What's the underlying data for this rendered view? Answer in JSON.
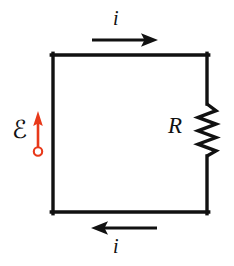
{
  "figure": {
    "kind": "circuit-diagram",
    "background_color": "#ffffff",
    "width": 234,
    "height": 266
  },
  "colors": {
    "wire": "#111111",
    "arrow_current": "#111111",
    "emf_accent": "#e8391a",
    "text": "#111111"
  },
  "labels": {
    "current_top": "i",
    "current_bottom": "i",
    "resistance": "R",
    "emf": "ℰ"
  },
  "components": {
    "loop": {
      "name": "circuit-loop",
      "left_x": 53,
      "right_x": 207,
      "top_y": 55,
      "bottom_y": 212,
      "stroke_width": 3.4
    },
    "resistor": {
      "name": "resistor",
      "label": "R",
      "orientation": "vertical",
      "center_x": 207,
      "top_y": 103,
      "bottom_y": 157,
      "zigzag_amplitude": 9,
      "zigzag_cycles": 4
    },
    "emf_source": {
      "name": "emf-source",
      "label": "ℰ",
      "arrow_x": 38,
      "arrow_tail_y": 151,
      "arrow_tip_y": 112,
      "terminal_circle_y": 151,
      "terminal_circle_radius": 4.2,
      "direction": "up",
      "color": "#e8391a"
    },
    "current_arrow_top": {
      "name": "current-arrow-top",
      "label": "i",
      "y": 40,
      "start_x": 92,
      "end_x": 157,
      "direction": "right"
    },
    "current_arrow_bottom": {
      "name": "current-arrow-bottom",
      "label": "i",
      "y": 228,
      "start_x": 157,
      "end_x": 92,
      "direction": "left"
    }
  }
}
